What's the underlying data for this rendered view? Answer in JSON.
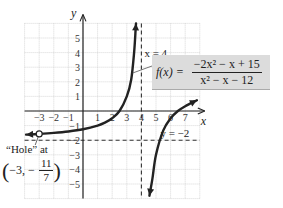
{
  "chart_data": {
    "type": "line",
    "title": "",
    "function_label": "f(x) =",
    "function_numerator": "−2x² − x + 15",
    "function_denominator": "x² − x − 12",
    "xlabel": "x",
    "ylabel": "y",
    "xlim": [
      -4,
      8
    ],
    "ylim": [
      -6,
      6
    ],
    "grid": true,
    "x_ticks": [
      -3,
      -2,
      -1,
      1,
      2,
      3,
      4,
      5,
      6,
      7
    ],
    "x_tick_labels": [
      "−3",
      "−2",
      "−1",
      "1",
      "2",
      "3",
      "4",
      "5",
      "6",
      "7"
    ],
    "y_ticks": [
      5,
      4,
      3,
      2,
      1,
      -1,
      -2,
      -3,
      -4,
      -5
    ],
    "y_tick_labels": [
      "5",
      "4",
      "3",
      "2",
      "1",
      "−1",
      "−2",
      "−3",
      "−4",
      "−5"
    ],
    "asymptotes": {
      "vertical": {
        "x": 4,
        "label": "x = 4"
      },
      "horizontal": {
        "y": -2,
        "label": "y = −2"
      }
    },
    "hole": {
      "x": -3,
      "y": -1.5714,
      "label_line1": "“Hole” at",
      "label_coord_prefix": "−3, −",
      "label_frac_num": "11",
      "label_frac_den": "7"
    },
    "series": [
      {
        "name": "left branch",
        "note": "f(x) = (-2x+5)/(x-4) for x < 4, arrows at both ends",
        "points": [
          [
            -3.9,
            -1.62
          ],
          [
            -3,
            -1.571
          ],
          [
            -2,
            -1.5
          ],
          [
            -1,
            -1.4
          ],
          [
            0,
            -1.25
          ],
          [
            1,
            -1.0
          ],
          [
            1.5,
            -0.8
          ],
          [
            2,
            -0.5
          ],
          [
            2.5,
            0.0
          ],
          [
            3,
            1.0
          ],
          [
            3.3,
            2.14
          ],
          [
            3.5,
            4.0
          ],
          [
            3.6,
            5.5
          ],
          [
            3.63,
            6.0
          ]
        ]
      },
      {
        "name": "right branch",
        "note": "arrows at both ends",
        "points": [
          [
            4.55,
            -5.8
          ],
          [
            4.75,
            -4.67
          ],
          [
            5,
            -3.0
          ],
          [
            5.5,
            -1.33
          ],
          [
            6,
            -0.5
          ],
          [
            6.5,
            0.0
          ],
          [
            7,
            0.33
          ],
          [
            7.8,
            0.74
          ]
        ]
      }
    ]
  }
}
